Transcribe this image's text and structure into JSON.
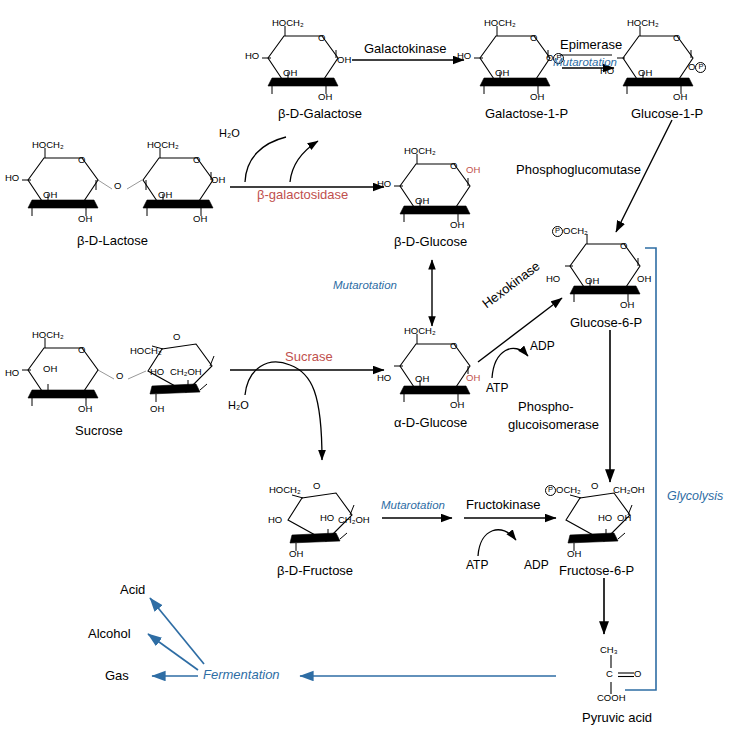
{
  "diagram": {
    "colors": {
      "enzyme_red": "#c0504d",
      "process_blue": "#2e6da4",
      "line_black": "#000000"
    }
  },
  "molecules": {
    "b_d_galactose": {
      "name": "β-D-Galactose"
    },
    "galactose_1_p": {
      "name": "Galactose-1-P"
    },
    "glucose_1_p": {
      "name": "Glucose-1-P"
    },
    "b_d_lactose": {
      "name": "β-D-Lactose"
    },
    "b_d_glucose": {
      "name": "β-D-Glucose"
    },
    "glucose_6_p": {
      "name": "Glucose-6-P"
    },
    "sucrose": {
      "name": "Sucrose"
    },
    "a_d_glucose": {
      "name": "α-D-Glucose"
    },
    "b_d_fructose": {
      "name": "β-D-Fructose"
    },
    "fructose_6_p": {
      "name": "Fructose-6-P"
    },
    "pyruvic_acid": {
      "name": "Pyruvic acid"
    }
  },
  "enzymes": {
    "galactokinase": "Galactokinase",
    "epimerase": "Epimerase",
    "phosphoglucomutase": "Phosphoglucomutase",
    "b_galactosidase": "β-galactosidase",
    "sucrase": "Sucrase",
    "hexokinase": "Hexokinase",
    "phosphoglucoisomerase_l1": "Phospho-",
    "phosphoglucoisomerase_l2": "glucoisomerase",
    "fructokinase": "Fructokinase"
  },
  "processes": {
    "mutarotation_top": "Mutarotation",
    "mutarotation_mid": "Mutarotation",
    "mutarotation_fru": "Mutarotation",
    "glycolysis": "Glycolysis",
    "fermentation": "Fermentation"
  },
  "cofactors": {
    "atp_hexokinase": "ATP",
    "adp_hexokinase": "ADP",
    "atp_fructokinase": "ATP",
    "adp_fructokinase": "ADP",
    "water_lactose": "H₂O",
    "water_sucrose": "H₂O"
  },
  "products": {
    "acid": "Acid",
    "alcohol": "Alcohol",
    "gas": "Gas"
  },
  "groups": {
    "hoch2": "HOCH₂",
    "ho": "HO",
    "oh": "OH",
    "o": "O",
    "ch2oh": "CH₂OH",
    "p_och2": "OCH₂",
    "o_p": "O",
    "p": "P",
    "ch3": "CH₃",
    "c": "C",
    "cooh": "COOH"
  }
}
